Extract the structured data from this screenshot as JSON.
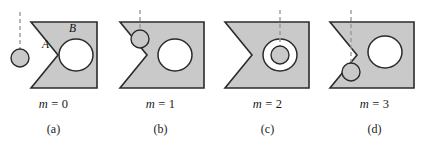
{
  "figure": {
    "colors": {
      "body_fill": "#c9c9c9",
      "body_stroke": "#2b2b2b",
      "hole_fill": "#ffffff",
      "small_circle_fill": "#c9c9c9",
      "dashed_line": "#9a9a9a",
      "text": "#1a1a1a",
      "background": "#ffffff"
    },
    "panels": [
      {
        "id": "a",
        "caption_label": "(a)",
        "m_symbol": "m",
        "m_equals": "=",
        "m_value": "0",
        "region_labels": [
          {
            "text": "A",
            "x": 46,
            "y": 46
          },
          {
            "text": "B",
            "x": 72,
            "y": 30
          }
        ],
        "small_circle": {
          "cx": 20,
          "cy": 58,
          "r": 9,
          "filled": true
        },
        "dashed_line": {
          "x": 20,
          "y1": 12,
          "y2": 50
        },
        "large_hole": {
          "cx": 76,
          "cy": 55,
          "rx": 17,
          "ry": 16
        }
      },
      {
        "id": "b",
        "caption_label": "(b)",
        "m_symbol": "m",
        "m_equals": "=",
        "m_value": "1",
        "region_labels": [],
        "small_circle": {
          "cx": 41,
          "cy": 40,
          "r": 9,
          "filled": true
        },
        "dashed_line": {
          "x": 41,
          "y1": 12,
          "y2": 32
        },
        "large_hole": {
          "cx": 76,
          "cy": 55,
          "rx": 17,
          "ry": 16
        }
      },
      {
        "id": "c",
        "caption_label": "(c)",
        "m_symbol": "m",
        "m_equals": "=",
        "m_value": "2",
        "region_labels": [],
        "small_circle": {
          "cx": 76,
          "cy": 55,
          "r": 9,
          "filled": true
        },
        "dashed_line": {
          "x": 76,
          "y1": 12,
          "y2": 46
        },
        "large_hole": {
          "cx": 76,
          "cy": 55,
          "rx": 17,
          "ry": 16
        }
      },
      {
        "id": "d",
        "caption_label": "(d)",
        "m_symbol": "m",
        "m_equals": "=",
        "m_value": "3",
        "region_labels": [],
        "small_circle": {
          "cx": 36,
          "cy": 72,
          "r": 9,
          "filled": true
        },
        "dashed_line": {
          "x": 36,
          "y1": 12,
          "y2": 64
        },
        "large_hole": {
          "cx": 76,
          "cy": 55,
          "rx": 17,
          "ry": 16
        }
      }
    ]
  }
}
